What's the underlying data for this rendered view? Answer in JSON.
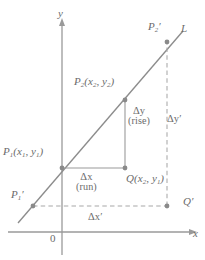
{
  "figure": {
    "type": "coordinate-geometry-diagram",
    "background_color": "#ffffff",
    "ink_color": "#7a7a7a",
    "line_color": "#8c8c8c",
    "axis_color": "#9a9a9a"
  },
  "axes": {
    "x_label": "x",
    "y_label": "y",
    "origin_label": "0",
    "x_axis_y_px": 232,
    "y_axis_x_px": 62
  },
  "line": {
    "name_label": "L",
    "points_px": [
      [
        18,
        223
      ],
      [
        183,
        31
      ]
    ]
  },
  "points": [
    {
      "id": "P1prime",
      "label_html": "P<sub>1</sub>′",
      "label_text": "P₁′",
      "x_px": 33,
      "y_px": 206
    },
    {
      "id": "P1",
      "label_html": "P<sub>1</sub>(x<sub>1</sub>, y<sub>1</sub>)",
      "label_text": "P₁(x₁, y₁)",
      "x_px": 62,
      "y_px": 168
    },
    {
      "id": "P2",
      "label_html": "P<sub>2</sub>(x<sub>2</sub>, y<sub>2</sub>)",
      "label_text": "P₂(x₂, y₂)",
      "x_px": 125,
      "y_px": 100
    },
    {
      "id": "P2prime",
      "label_html": "P<sub>2</sub>′",
      "label_text": "P₂′",
      "x_px": 167,
      "y_px": 42
    },
    {
      "id": "Q",
      "label_html": "Q(x<sub>2</sub>, y<sub>1</sub>)",
      "label_text": "Q(x₂, y₁)",
      "x_px": 125,
      "y_px": 168
    },
    {
      "id": "Qprime",
      "label_html": "Q′",
      "label_text": "Q′",
      "x_px": 167,
      "y_px": 206
    }
  ],
  "annotations": {
    "delta_y": {
      "symbol": "Δy",
      "note": "(rise)"
    },
    "delta_x": {
      "symbol": "Δx",
      "note": "(run)"
    },
    "delta_y_prime": {
      "symbol": "Δy′"
    },
    "delta_x_prime": {
      "symbol": "Δx′"
    }
  },
  "segments": {
    "solid": [
      {
        "name": "run-segment",
        "from": "P1",
        "to": "Q"
      },
      {
        "name": "rise-segment",
        "from": "Q",
        "to": "P2"
      }
    ],
    "dashed": [
      {
        "name": "run-prime-segment",
        "from": "P1prime",
        "to": "Qprime"
      },
      {
        "name": "rise-prime-segment",
        "from": "Qprime",
        "to": "P2prime"
      }
    ]
  }
}
